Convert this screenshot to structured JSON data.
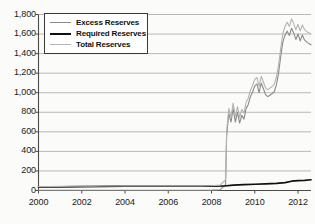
{
  "chart_data": {
    "type": "line",
    "title": "",
    "subtitle": "",
    "xlabel": "",
    "ylabel": "",
    "xlim": [
      2000.0,
      2012.6
    ],
    "ylim": [
      0,
      1800
    ],
    "grid": true,
    "grid_axis": "y",
    "legend_position": "top-left-inside",
    "yticks": [
      0,
      200,
      400,
      600,
      800,
      1000,
      1200,
      1400,
      1600,
      1800
    ],
    "ytick_labels": [
      "0",
      "200",
      "400",
      "600",
      "800",
      "1,000",
      "1,200",
      "1,400",
      "1,600",
      "1,800"
    ],
    "xticks": [
      2000,
      2002,
      2004,
      2006,
      2008,
      2010,
      2012
    ],
    "xtick_labels": [
      "2000",
      "2002",
      "2004",
      "2006",
      "2008",
      "2010",
      "2012"
    ],
    "series": [
      {
        "name": "Excess Reserves",
        "color": "#8a8a8a",
        "width": 1.1,
        "x": [
          2000.0,
          2000.5,
          2001.0,
          2001.5,
          2002.0,
          2002.5,
          2003.0,
          2003.5,
          2004.0,
          2004.5,
          2005.0,
          2005.5,
          2006.0,
          2006.5,
          2007.0,
          2007.5,
          2008.0,
          2008.4,
          2008.65,
          2008.7,
          2008.8,
          2008.9,
          2009.0,
          2009.1,
          2009.2,
          2009.3,
          2009.4,
          2009.5,
          2009.6,
          2009.7,
          2009.8,
          2009.9,
          2010.0,
          2010.1,
          2010.2,
          2010.3,
          2010.4,
          2010.5,
          2010.6,
          2010.7,
          2010.8,
          2010.9,
          2011.0,
          2011.1,
          2011.2,
          2011.3,
          2011.4,
          2011.5,
          2011.6,
          2011.7,
          2011.8,
          2011.9,
          2012.0,
          2012.1,
          2012.2,
          2012.3,
          2012.45,
          2012.6
        ],
        "y": [
          2,
          2,
          3,
          3,
          3,
          3,
          3,
          3,
          3,
          3,
          3,
          3,
          3,
          3,
          3,
          3,
          4,
          8,
          60,
          560,
          790,
          700,
          840,
          700,
          800,
          690,
          770,
          730,
          840,
          880,
          960,
          1010,
          1070,
          1090,
          1000,
          1100,
          1040,
          980,
          960,
          975,
          990,
          1010,
          1080,
          1200,
          1370,
          1520,
          1590,
          1630,
          1585,
          1660,
          1610,
          1545,
          1600,
          1530,
          1590,
          1540,
          1510,
          1490
        ]
      },
      {
        "name": "Required Reserves",
        "color": "#101010",
        "width": 1.7,
        "x": [
          2000.0,
          2001.0,
          2002.0,
          2003.0,
          2004.0,
          2005.0,
          2006.0,
          2007.0,
          2008.0,
          2008.6,
          2009.0,
          2009.5,
          2010.0,
          2010.5,
          2011.0,
          2011.4,
          2011.7,
          2012.0,
          2012.3,
          2012.6
        ],
        "y": [
          38,
          38,
          40,
          42,
          44,
          44,
          45,
          44,
          44,
          46,
          55,
          60,
          64,
          68,
          72,
          80,
          95,
          100,
          104,
          110
        ]
      },
      {
        "name": "Total Reserves",
        "color": "#b3b3b3",
        "width": 1.1,
        "x": [
          2000.0,
          2000.5,
          2001.0,
          2001.5,
          2002.0,
          2002.5,
          2003.0,
          2003.5,
          2004.0,
          2004.5,
          2005.0,
          2005.5,
          2006.0,
          2006.5,
          2007.0,
          2007.5,
          2008.0,
          2008.4,
          2008.65,
          2008.7,
          2008.8,
          2008.9,
          2009.0,
          2009.1,
          2009.2,
          2009.3,
          2009.4,
          2009.5,
          2009.6,
          2009.7,
          2009.8,
          2009.9,
          2010.0,
          2010.1,
          2010.2,
          2010.3,
          2010.4,
          2010.5,
          2010.6,
          2010.7,
          2010.8,
          2010.9,
          2011.0,
          2011.1,
          2011.2,
          2011.3,
          2011.4,
          2011.5,
          2011.6,
          2011.7,
          2011.8,
          2011.9,
          2012.0,
          2012.1,
          2012.2,
          2012.3,
          2012.45,
          2012.6
        ],
        "y": [
          41,
          41,
          42,
          44,
          45,
          45,
          46,
          46,
          47,
          47,
          47,
          47,
          47,
          47,
          47,
          47,
          48,
          55,
          110,
          610,
          840,
          748,
          895,
          757,
          858,
          748,
          830,
          792,
          902,
          944,
          1024,
          1076,
          1136,
          1156,
          1066,
          1168,
          1110,
          1050,
          1030,
          1047,
          1064,
          1086,
          1158,
          1282,
          1455,
          1606,
          1678,
          1720,
          1678,
          1755,
          1707,
          1643,
          1700,
          1632,
          1694,
          1646,
          1618,
          1600
        ]
      }
    ]
  },
  "legend": {
    "items": [
      {
        "label": "Excess Reserves"
      },
      {
        "label": "Required Reserves"
      },
      {
        "label": "Total Reserves"
      }
    ]
  },
  "colors": {
    "background": "#fbfbfa",
    "grid": "#8c8c8c",
    "axis": "#4a4a4a",
    "text": "#1a1a1a",
    "legend_border": "#3a3a3a"
  }
}
